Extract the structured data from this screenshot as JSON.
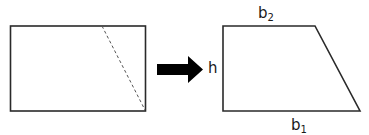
{
  "diagram": {
    "left_figure": {
      "shape": "rectangle",
      "cut_line": "dashed"
    },
    "arrow": {
      "direction": "right",
      "color": "#000000"
    },
    "right_figure": {
      "shape": "trapezoid",
      "labels": {
        "top_base": {
          "main": "b",
          "sub": "2"
        },
        "height": "h",
        "bottom_base": {
          "main": "b",
          "sub": "1"
        }
      }
    },
    "colors": {
      "stroke": "#2a2a2a",
      "dashed": "#555555",
      "background": "#ffffff",
      "text": "#1a1a1a"
    }
  }
}
